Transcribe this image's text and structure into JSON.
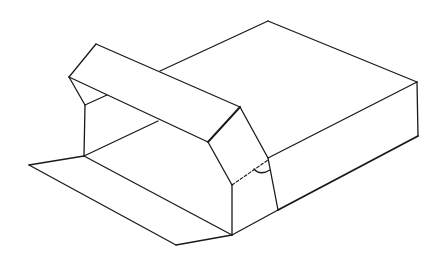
{
  "figure": {
    "stroke_color": "#1a1a1a",
    "background_color": "#ffffff"
  },
  "parts": {
    "box_top_panel": "box-top-panel",
    "box_front_side": "box-front-side",
    "box_right_end": "box-right-end",
    "raised_lid_flap": "raised-lid-flap",
    "lid_end_panel": "lid-end-panel",
    "open_end_interior": "open-end-interior",
    "bottom_extension_flap": "bottom-extension-flap",
    "fold_angle_marker": "fold-angle-marker",
    "dashed_fold_line": "dashed-fold-line"
  }
}
